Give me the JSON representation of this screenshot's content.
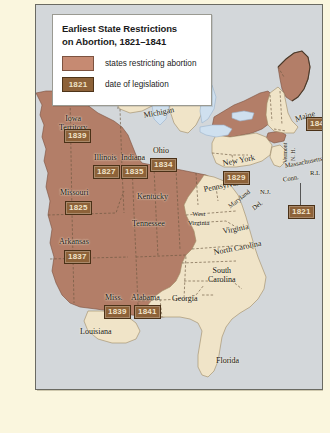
{
  "legend": {
    "title_line1": "Earliest State Restrictions",
    "title_line2": "on Abortion, 1821–1841",
    "items": [
      {
        "type": "swatch",
        "label": "states restricting abortion",
        "color": "#c68a72"
      },
      {
        "type": "date",
        "sample": "1821",
        "label": "date of legislation",
        "color": "#8d6239"
      }
    ]
  },
  "colors": {
    "restricted_fill": "#b37e68",
    "unrestricted_fill": "#f0e4c8",
    "water": "#cfe0ef",
    "ocean": "#d3d7da",
    "page": "#faf6de",
    "date_box": "#8d6239",
    "date_text": "#f1e4cb",
    "border": "#6a6a62"
  },
  "map": {
    "title": "Earliest State Restrictions on Abortion, 1821–1841",
    "restricted_states": [
      {
        "name": "Iowa Territory",
        "date": "1839"
      },
      {
        "name": "Missouri",
        "date": "1825"
      },
      {
        "name": "Arkansas",
        "date": "1837"
      },
      {
        "name": "Illinois",
        "date": "1827"
      },
      {
        "name": "Indiana",
        "date": "1835"
      },
      {
        "name": "Ohio",
        "date": "1834"
      },
      {
        "name": "Miss.",
        "date": "1839"
      },
      {
        "name": "Alabama",
        "date": "1841"
      },
      {
        "name": "New York",
        "date": "1829"
      },
      {
        "name": "Maine",
        "date": "1840"
      },
      {
        "name": "Conn.",
        "date": "1821"
      }
    ],
    "unrestricted_states": [
      "Wisconsin Territory",
      "Michigan",
      "Kentucky",
      "Tennessee",
      "Louisiana",
      "Georgia",
      "Florida",
      "South Carolina",
      "North Carolina",
      "Virginia",
      "West Virginia",
      "Maryland",
      "Del.",
      "Pennsylvania",
      "N.J.",
      "Vermont",
      "N.H.",
      "Massachusetts",
      "R.I."
    ],
    "labels": [
      {
        "id": "wisconsin-territory",
        "text": "Wisconsin",
        "text2": "Territory"
      },
      {
        "id": "iowa-territory",
        "text": "Iowa",
        "text2": "Territory"
      },
      {
        "id": "michigan",
        "text": "Michigan"
      },
      {
        "id": "illinois",
        "text": "Illinois"
      },
      {
        "id": "indiana",
        "text": "Indiana"
      },
      {
        "id": "ohio",
        "text": "Ohio"
      },
      {
        "id": "missouri",
        "text": "Missouri"
      },
      {
        "id": "arkansas",
        "text": "Arkansas"
      },
      {
        "id": "kentucky",
        "text": "Kentucky"
      },
      {
        "id": "tennessee",
        "text": "Tennessee"
      },
      {
        "id": "mississippi",
        "text": "Miss."
      },
      {
        "id": "alabama",
        "text": "Alabama"
      },
      {
        "id": "louisiana",
        "text": "Louisiana"
      },
      {
        "id": "georgia",
        "text": "Georgia"
      },
      {
        "id": "florida",
        "text": "Florida"
      },
      {
        "id": "south-carolina",
        "text": "South",
        "text2": "Carolina"
      },
      {
        "id": "north-carolina",
        "text": "North Carolina"
      },
      {
        "id": "virginia",
        "text": "Virginia"
      },
      {
        "id": "west-virginia",
        "text": "West",
        "text2": "Virginia"
      },
      {
        "id": "maryland",
        "text": "Maryland"
      },
      {
        "id": "delaware",
        "text": "Del."
      },
      {
        "id": "pennsylvania",
        "text": "Pennsylvania"
      },
      {
        "id": "new-jersey",
        "text": "N.J."
      },
      {
        "id": "new-york",
        "text": "New York"
      },
      {
        "id": "vermont",
        "text": "Vermont"
      },
      {
        "id": "new-hampshire",
        "text": "N. H."
      },
      {
        "id": "massachusetts",
        "text": "Massachusetts"
      },
      {
        "id": "connecticut",
        "text": "Conn."
      },
      {
        "id": "rhode-island",
        "text": "R.I."
      },
      {
        "id": "maine",
        "text": "Maine"
      }
    ]
  }
}
